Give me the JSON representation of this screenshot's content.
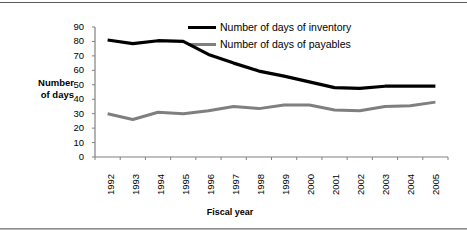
{
  "chart_data": {
    "type": "line",
    "title": "",
    "xlabel": "Fiscal year",
    "ylabel": "Number of days",
    "ylabel_line1": "Number",
    "ylabel_line2": "of days",
    "categories": [
      "1992",
      "1993",
      "1994",
      "1995",
      "1996",
      "1997",
      "1998",
      "1999",
      "2000",
      "2001",
      "2002",
      "2003",
      "2004",
      "2005"
    ],
    "yticks": [
      "0",
      "10",
      "20",
      "30",
      "40",
      "50",
      "60",
      "70",
      "80",
      "90"
    ],
    "ylim": [
      0,
      90
    ],
    "grid": false,
    "legend_position": "top-right",
    "series": [
      {
        "name": "Number of days of inventory",
        "color": "#000000",
        "values": [
          81,
          78.5,
          80.5,
          80,
          71,
          65,
          59.5,
          56,
          52,
          48,
          47.5,
          49,
          49,
          49
        ]
      },
      {
        "name": "Number of days of payables",
        "color": "#7f7f7f",
        "values": [
          30,
          26,
          31,
          30,
          32,
          35,
          33.5,
          36,
          36,
          32.5,
          32,
          35,
          35.5,
          38
        ]
      }
    ]
  },
  "legend": {
    "items": [
      {
        "label": "Number of days of inventory",
        "color": "#000000"
      },
      {
        "label": "Number of days of payables",
        "color": "#7f7f7f"
      }
    ]
  },
  "colors": {
    "inventory": "#000000",
    "payables": "#7f7f7f",
    "axis": "#808080",
    "text": "#000000",
    "background": "#ffffff"
  }
}
